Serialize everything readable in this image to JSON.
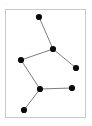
{
  "canvas": {
    "width": 92,
    "height": 126,
    "background_color": "#ffffff"
  },
  "top_marks": {
    "text": "···· ·· ···",
    "color": "#d2d2d2"
  },
  "frame": {
    "name": "diagram-frame",
    "x": 5,
    "y": 9,
    "width": 81,
    "height": 109,
    "border_color": "#c9c9c9",
    "fill_color": "#ffffff"
  },
  "diagram": {
    "type": "node-link-graph",
    "title": "",
    "node_color": "#0b0b0b",
    "node_radius": 3.1,
    "edge_color": "#6e6e6e",
    "edge_width": 0.9,
    "nodes": [
      {
        "id": "n1",
        "label": "",
        "x": 39,
        "y": 17
      },
      {
        "id": "n2",
        "label": "",
        "x": 53,
        "y": 49
      },
      {
        "id": "n3",
        "label": "",
        "x": 76,
        "y": 68
      },
      {
        "id": "n4",
        "label": "",
        "x": 21,
        "y": 60
      },
      {
        "id": "n5",
        "label": "",
        "x": 40,
        "y": 89
      },
      {
        "id": "n6",
        "label": "",
        "x": 72,
        "y": 88
      },
      {
        "id": "n7",
        "label": "",
        "x": 24,
        "y": 110
      }
    ],
    "edges": [
      {
        "from": "n1",
        "to": "n2"
      },
      {
        "from": "n2",
        "to": "n3"
      },
      {
        "from": "n2",
        "to": "n4"
      },
      {
        "from": "n4",
        "to": "n5"
      },
      {
        "from": "n5",
        "to": "n6"
      },
      {
        "from": "n5",
        "to": "n7"
      }
    ]
  }
}
